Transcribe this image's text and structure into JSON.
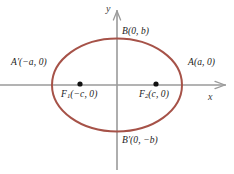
{
  "figure": {
    "colors": {
      "curve": "#a65248",
      "axis": "#9a9a9a",
      "point": "#111111",
      "text": "#1a1a1a",
      "background": "#ffffff"
    },
    "axes": {
      "x_label": "x",
      "y_label": "y",
      "x_axis": {
        "y": 85,
        "x_start": 0,
        "x_end": 226,
        "arrow": "right"
      },
      "y_axis": {
        "x": 117,
        "y_start": 10,
        "y_end": 170,
        "arrow": "up"
      }
    },
    "ellipse": {
      "center_x": 117,
      "center_y": 85,
      "semi_major_px": 65,
      "semi_minor_px": 46.5,
      "stroke_width": 2
    },
    "labels": {
      "vertex_left": "A′(−a, 0)",
      "vertex_right": "A(a, 0)",
      "covertex_top": "B(0, b)",
      "covertex_bottom": "B′(0, −b)",
      "focus_left_name": "F",
      "focus_left_sub": "1",
      "focus_left_coords": "(−c, 0)",
      "focus_right_name": "F",
      "focus_right_sub": "2",
      "focus_right_coords": "(c, 0)"
    },
    "points": [
      {
        "name": "focus-left",
        "x": 80,
        "y": 84,
        "r": 2.6
      },
      {
        "name": "focus-right",
        "x": 156,
        "y": 84,
        "r": 2.6
      }
    ]
  },
  "chart_data": {
    "type": "scatter",
    "xlabel": "x",
    "ylabel": "y",
    "grid": false,
    "legend": false,
    "xlim": [
      -1.8,
      1.68
    ],
    "ylim": [
      -1.61,
      1.61
    ],
    "curves": [
      {
        "name": "ellipse",
        "equation": "x^2/a^2 + y^2/b^2 = 1",
        "semi_major_a": 1.0,
        "semi_minor_b": 0.715,
        "center": [
          0,
          0
        ],
        "color": "#a65248"
      }
    ],
    "annotated_points": [
      {
        "label": "A′(−a, 0)",
        "x": -1.0,
        "y": 0.0
      },
      {
        "label": "A(a, 0)",
        "x": 1.0,
        "y": 0.0
      },
      {
        "label": "B(0, b)",
        "x": 0.0,
        "y": 0.715
      },
      {
        "label": "B′(0, −b)",
        "x": 0.0,
        "y": -0.715
      },
      {
        "label": "F₁(−c, 0)",
        "x": -0.569,
        "y": 0.0,
        "marker": "dot"
      },
      {
        "label": "F₂(c, 0)",
        "x": 0.6,
        "y": 0.0,
        "marker": "dot"
      }
    ]
  }
}
